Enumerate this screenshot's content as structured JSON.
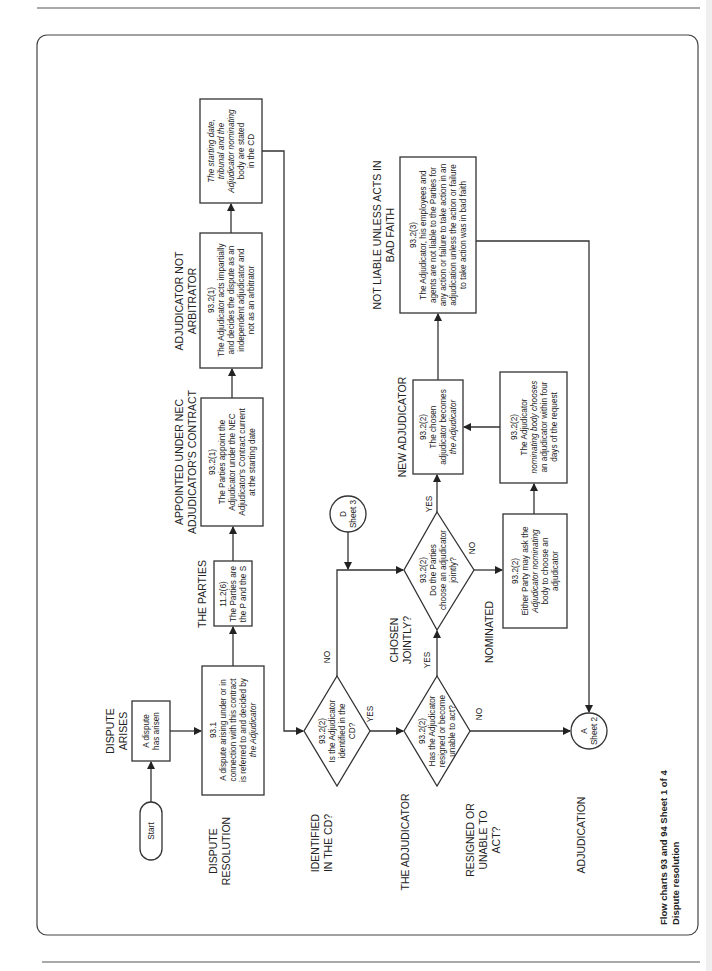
{
  "page": {
    "title_line1": "Flow charts 93 and 94   Sheet 1 of 4",
    "title_line2": "Dispute resolution"
  },
  "row_labels": {
    "dispute_arises": [
      "DISPUTE",
      "ARISES"
    ],
    "dispute_resolution": [
      "DISPUTE",
      "RESOLUTION"
    ],
    "identified": [
      "IDENTIFIED",
      "IN THE CD?"
    ],
    "the_adjudicator": [
      "THE ADJUDICATOR"
    ],
    "resigned": [
      "RESIGNED OR",
      "UNABLE TO",
      "ACT?"
    ],
    "adjudication": [
      "ADJUDICATION"
    ],
    "the_parties": [
      "THE PARTIES"
    ],
    "appointed": [
      "APPOINTED UNDER NEC",
      "ADJUDICATOR'S CONTRACT"
    ],
    "not_arbitrator": [
      "ADJUDICATOR NOT",
      "ARBITRATOR"
    ],
    "chosen_jointly": [
      "CHOSEN",
      "JOINTLY?"
    ],
    "nominated": [
      "NOMINATED"
    ],
    "new_adjudicator": [
      "NEW ADJUDICATOR"
    ],
    "not_liable": [
      "NOT LIABLE UNLESS ACTS IN",
      "BAD FAITH"
    ]
  },
  "nodes": {
    "start": "Start",
    "dispute_arisen": [
      "A dispute",
      "has arisen"
    ],
    "clause_93_1": [
      "93.1",
      "A dispute arising under or in",
      "connection with this contract",
      "is referred to and decided by",
      "the Adjudicator"
    ],
    "clause_11_2_6": [
      "11.2(6)",
      "The Parties are",
      "the P and the S"
    ],
    "clause_93_2_1_appoint": [
      "93.2(1)",
      "The Parties appoint the",
      "Adjudicator under the NEC",
      "Adjudicator's Contract current",
      "at the starting date"
    ],
    "clause_93_2_1_impartial": [
      "93.2(1)",
      "The Adjudicator acts impartially",
      "and decides the dispute as an",
      "independent adjudicator and",
      "not as an arbitrator"
    ],
    "starting_date_box": [
      "The starting date,",
      "tribunal and the",
      "Adjudicator nominating",
      "body are stated",
      "in the CD"
    ],
    "decision_identified": [
      "93.2(2)",
      "Is the Adjudicator",
      "identified in the",
      "CD?"
    ],
    "decision_resigned": [
      "93.2(2)",
      "Has the Adjudicator",
      "resigned or become",
      "unable to act?"
    ],
    "decision_jointly": [
      "93.2(2)",
      "Do the Parties",
      "choose an adjudicator",
      "jointly?"
    ],
    "either_party": [
      "93.2(2)",
      "Either Party may ask the",
      "Adjudicator nominating",
      "body to choose an",
      "adjudicator"
    ],
    "nominating_body": [
      "93.2(2)",
      "The Adjudicator",
      "nominating body chooses",
      "an adjudicator within four",
      "days of the request"
    ],
    "chosen_becomes": [
      "93.2(2)",
      "The chosen",
      "adjudicator becomes",
      "the Adjudicator"
    ],
    "clause_93_2_3": [
      "93.2(3)",
      "The Adjudicator, his employees and",
      "agents are not liable to the Parties for",
      "any action or failure to take action in an",
      "adjudication unless the action or failure",
      "to take action was in bad faith"
    ],
    "connector_d": [
      "D",
      "Sheet 3"
    ],
    "connector_a": [
      "A",
      "Sheet 2"
    ]
  },
  "edge_labels": {
    "yes": "YES",
    "no": "NO"
  }
}
